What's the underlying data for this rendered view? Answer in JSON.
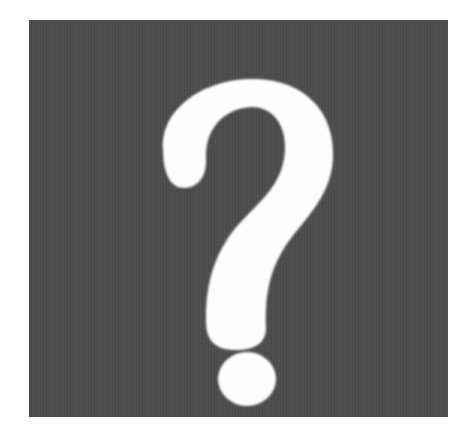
{
  "image": {
    "subject": "question mark",
    "glyph": "?",
    "background_color": "#4b4b4b",
    "symbol_color": "#fdfdfd",
    "page_color": "#ffffff"
  }
}
